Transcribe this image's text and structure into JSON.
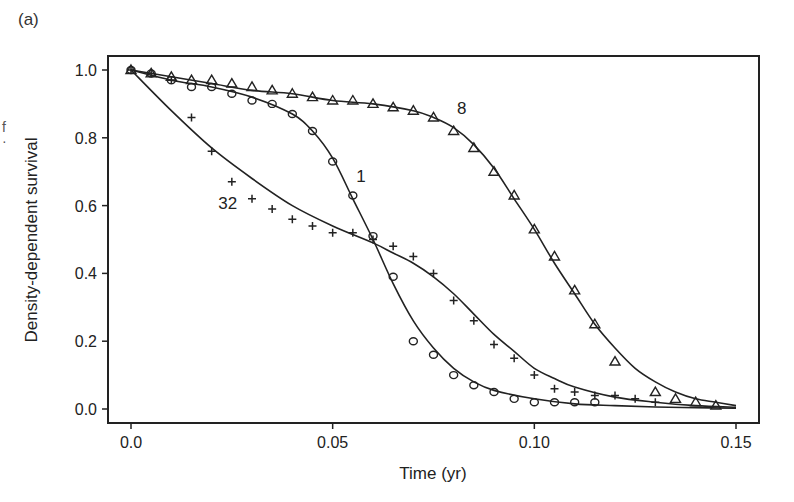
{
  "figure": {
    "panel_label": "(a)",
    "stray_marks": "f\n:"
  },
  "chart_data": {
    "type": "scatter",
    "title": "",
    "panel": "(a)",
    "xlabel": "Time (yr)",
    "ylabel": "Density-dependent survival",
    "xlim": [
      0.0,
      0.15
    ],
    "ylim": [
      0.0,
      1.0
    ],
    "xticks": [
      0.0,
      0.05,
      0.1,
      0.15
    ],
    "xtick_labels": [
      "0.0",
      "0.05",
      "0.10",
      "0.15"
    ],
    "yticks": [
      0.0,
      0.2,
      0.4,
      0.6,
      0.8,
      1.0
    ],
    "ytick_labels": [
      "0.0",
      "0.2",
      "0.4",
      "0.6",
      "0.8",
      "1.0"
    ],
    "grid": false,
    "legend": "inline curve labels",
    "series": [
      {
        "name": "1",
        "marker": "circle",
        "label_position": [
          0.057,
          0.67
        ],
        "x": [
          0.0,
          0.005,
          0.01,
          0.015,
          0.02,
          0.025,
          0.03,
          0.035,
          0.04,
          0.045,
          0.05,
          0.055,
          0.06,
          0.065,
          0.07,
          0.075,
          0.08,
          0.085,
          0.09,
          0.095,
          0.1,
          0.105,
          0.11,
          0.115
        ],
        "y": [
          1.0,
          0.99,
          0.97,
          0.95,
          0.95,
          0.93,
          0.91,
          0.9,
          0.87,
          0.82,
          0.73,
          0.63,
          0.51,
          0.39,
          0.2,
          0.16,
          0.1,
          0.07,
          0.05,
          0.03,
          0.02,
          0.02,
          0.02,
          0.02
        ],
        "fit_x": [
          0.0,
          0.01,
          0.02,
          0.03,
          0.04,
          0.045,
          0.05,
          0.055,
          0.06,
          0.065,
          0.07,
          0.075,
          0.08,
          0.085,
          0.09,
          0.1,
          0.11,
          0.12,
          0.13,
          0.14,
          0.15
        ],
        "fit_y": [
          1.0,
          0.97,
          0.95,
          0.92,
          0.87,
          0.82,
          0.74,
          0.62,
          0.5,
          0.37,
          0.26,
          0.18,
          0.12,
          0.08,
          0.055,
          0.03,
          0.015,
          0.01,
          0.006,
          0.004,
          0.002
        ]
      },
      {
        "name": "8",
        "marker": "triangle",
        "label_position": [
          0.082,
          0.87
        ],
        "x": [
          0.0,
          0.005,
          0.01,
          0.015,
          0.02,
          0.025,
          0.03,
          0.035,
          0.04,
          0.045,
          0.05,
          0.055,
          0.06,
          0.065,
          0.07,
          0.075,
          0.08,
          0.085,
          0.09,
          0.095,
          0.1,
          0.105,
          0.11,
          0.115,
          0.12,
          0.13,
          0.135,
          0.14,
          0.145
        ],
        "y": [
          1.0,
          0.99,
          0.98,
          0.97,
          0.97,
          0.96,
          0.95,
          0.94,
          0.93,
          0.92,
          0.91,
          0.91,
          0.9,
          0.89,
          0.88,
          0.86,
          0.82,
          0.77,
          0.7,
          0.63,
          0.53,
          0.45,
          0.35,
          0.25,
          0.14,
          0.05,
          0.03,
          0.02,
          0.01
        ],
        "fit_x": [
          0.0,
          0.01,
          0.02,
          0.03,
          0.04,
          0.05,
          0.06,
          0.07,
          0.075,
          0.08,
          0.085,
          0.09,
          0.095,
          0.1,
          0.105,
          0.11,
          0.115,
          0.12,
          0.125,
          0.13,
          0.135,
          0.14,
          0.145,
          0.15
        ],
        "fit_y": [
          1.0,
          0.98,
          0.96,
          0.94,
          0.93,
          0.91,
          0.9,
          0.88,
          0.86,
          0.83,
          0.78,
          0.71,
          0.62,
          0.53,
          0.43,
          0.34,
          0.25,
          0.18,
          0.12,
          0.08,
          0.05,
          0.03,
          0.02,
          0.01
        ]
      },
      {
        "name": "32",
        "marker": "plus",
        "label_position": [
          0.024,
          0.59
        ],
        "x": [
          0.0,
          0.005,
          0.01,
          0.015,
          0.02,
          0.025,
          0.03,
          0.035,
          0.04,
          0.045,
          0.05,
          0.055,
          0.06,
          0.065,
          0.07,
          0.075,
          0.08,
          0.085,
          0.09,
          0.095,
          0.1,
          0.105,
          0.11,
          0.115,
          0.12,
          0.125,
          0.13
        ],
        "y": [
          1.0,
          0.99,
          0.97,
          0.86,
          0.76,
          0.67,
          0.62,
          0.59,
          0.56,
          0.54,
          0.52,
          0.52,
          0.5,
          0.48,
          0.45,
          0.4,
          0.32,
          0.26,
          0.19,
          0.15,
          0.1,
          0.06,
          0.05,
          0.04,
          0.04,
          0.03,
          0.02
        ],
        "fit_x": [
          0.0,
          0.01,
          0.02,
          0.03,
          0.04,
          0.05,
          0.06,
          0.065,
          0.07,
          0.075,
          0.08,
          0.085,
          0.09,
          0.095,
          0.1,
          0.105,
          0.11,
          0.12,
          0.13,
          0.14,
          0.15
        ],
        "fit_y": [
          1.0,
          0.88,
          0.77,
          0.68,
          0.6,
          0.54,
          0.49,
          0.46,
          0.43,
          0.39,
          0.34,
          0.28,
          0.22,
          0.17,
          0.12,
          0.09,
          0.065,
          0.035,
          0.02,
          0.01,
          0.005
        ]
      }
    ]
  }
}
